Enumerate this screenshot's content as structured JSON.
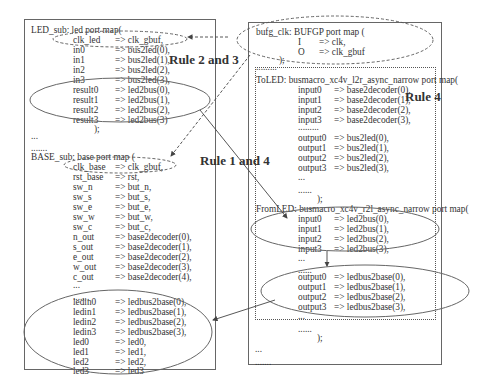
{
  "left_box": {
    "led_sub": {
      "header": "LED_sub: led port map(",
      "rows": [
        {
          "port": "clk_led",
          "sig": "=> clk_gbuf,"
        },
        {
          "port": "in0",
          "sig": "=> bus2led(0),"
        },
        {
          "port": "in1",
          "sig": "=> bus2led(1),"
        },
        {
          "port": "in2",
          "sig": "=> bus2led(2),"
        },
        {
          "port": "in3",
          "sig": "=> bus2led(3),"
        },
        {
          "port": "result0",
          "sig": "=> led2bus(0),"
        },
        {
          "port": "result1",
          "sig": "=> led2bus(1),"
        },
        {
          "port": "result2",
          "sig": "=> led2bus(2),"
        },
        {
          "port": "result3",
          "sig": "=> led2bus(3)"
        }
      ],
      "close": ");"
    },
    "ellipsis1": "...",
    "ellipsis2": ".......",
    "base_sub": {
      "header": "BASE_sub:   base port map (",
      "rows": [
        {
          "port": "clk_base",
          "sig": "=> clk_gbuf,"
        },
        {
          "port": "rst_base",
          "sig": "=> rst,"
        },
        {
          "port": "sw_n",
          "sig": "=> but_n,"
        },
        {
          "port": "sw_s",
          "sig": "=> but_s,"
        },
        {
          "port": "sw_e",
          "sig": "=> but_e,"
        },
        {
          "port": "sw_w",
          "sig": "=> but_w,"
        },
        {
          "port": "sw_c",
          "sig": "=> but_c,"
        },
        {
          "port": "n_out",
          "sig": "=> base2decoder(0),"
        },
        {
          "port": "s_out",
          "sig": "=> base2decoder(1),"
        },
        {
          "port": "e_out",
          "sig": "=> base2decoder(2),"
        },
        {
          "port": "w_out",
          "sig": "=> base2decoder(3),"
        },
        {
          "port": "c_out",
          "sig": "=> base2decoder(4),"
        }
      ],
      "ellipsis1": "...",
      "ellipsis2": ".......",
      "rows2": [
        {
          "port": "ledin0",
          "sig": "=> ledbus2base(0),"
        },
        {
          "port": "ledin1",
          "sig": "=> ledbus2base(1),"
        },
        {
          "port": "ledin2",
          "sig": "=> ledbus2base(2),"
        },
        {
          "port": "ledin3",
          "sig": "=> ledbus2base(3),"
        },
        {
          "port": "led0",
          "sig": "=> led0,"
        },
        {
          "port": "led1",
          "sig": "=> led1,"
        },
        {
          "port": "led2",
          "sig": "=> led2,"
        },
        {
          "port": "led3",
          "sig": "=> led3"
        }
      ]
    }
  },
  "right_box": {
    "bufg": {
      "header": "bufg_clk: BUFGP port map (",
      "rows": [
        {
          "port": "I",
          "sig": "=> clk,"
        },
        {
          "port": "O",
          "sig": "=> clk_gbuf"
        }
      ],
      "close": ");"
    },
    "toled": {
      "dots": ".........",
      "header": "ToLED: busmacro_xc4v_l2r_async_narrow port map(",
      "inputs": [
        {
          "port": "input0",
          "sig": "=> base2decoder(0),"
        },
        {
          "port": "input1",
          "sig": "=> base2decoder(1),"
        },
        {
          "port": "input2",
          "sig": "=> base2decoder(2),"
        },
        {
          "port": "input3",
          "sig": "=> base2decoder(3),"
        }
      ],
      "dots2": ".........",
      "outputs": [
        {
          "port": "output0",
          "sig": "=> bus2led(0),"
        },
        {
          "port": "output1",
          "sig": "=> bus2led(1),"
        },
        {
          "port": "output2",
          "sig": "=> bus2led(2),"
        },
        {
          "port": "output3",
          "sig": "=> bus2led(3),"
        }
      ],
      "ellipsis1": "...",
      "ellipsis2": "......",
      "close": ");"
    },
    "fromled": {
      "header": "FromLED: busmacro_xc4v_r2l_async_narrow port map(",
      "inputs": [
        {
          "port": "input0",
          "sig": "=> led2bus(0),"
        },
        {
          "port": "input1",
          "sig": "=> led2bus(1),"
        },
        {
          "port": "input2",
          "sig": "=> led2bus(2),"
        },
        {
          "port": "input3",
          "sig": "=> led2bus(3),"
        }
      ],
      "ellipsis1": "...",
      "ellipsis2": "......",
      "outputs": [
        {
          "port": "output0",
          "sig": "=> ledbus2base(0),"
        },
        {
          "port": "output1",
          "sig": "=> ledbus2base(1),"
        },
        {
          "port": "output2",
          "sig": "=> ledbus2base(2),"
        },
        {
          "port": "output3",
          "sig": "=> ledbus2base(3),"
        }
      ],
      "ellipsis3": "...",
      "ellipsis4": "......",
      "close": ");"
    },
    "ellipsis1": "...",
    "ellipsis2": "......."
  },
  "rules": {
    "rule23": "Rule 2 and 3",
    "rule14": "Rule 1 and 4",
    "rule4": "Rule 4"
  }
}
